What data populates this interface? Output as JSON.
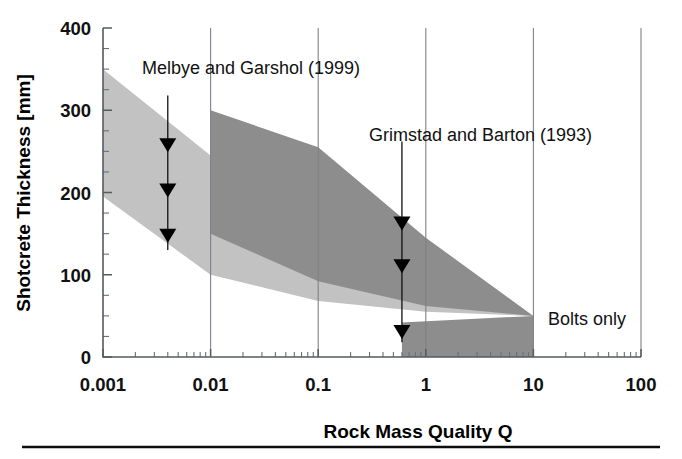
{
  "figure": {
    "caption_rule_visible": true,
    "background": "#ffffff"
  },
  "axes": {
    "x": {
      "title": "Rock Mass Quality Q",
      "scale": "log",
      "min": 0.001,
      "max": 100,
      "tick_labels": [
        "0.001",
        "0.01",
        "0.1",
        "1",
        "10",
        "100"
      ],
      "tick_values": [
        0.001,
        0.01,
        0.1,
        1,
        10,
        100
      ]
    },
    "y": {
      "title": "Shotcrete Thickness [mm]",
      "scale": "linear",
      "min": 0,
      "max": 400,
      "tick_labels": [
        "0",
        "100",
        "200",
        "300",
        "400"
      ],
      "tick_values": [
        0,
        100,
        200,
        300,
        400
      ],
      "minor_step": 25
    }
  },
  "annotations": [
    {
      "id": "melbye",
      "label": "Melbye and Garshol (1999)",
      "label_x": 0.0022,
      "label_y": 362,
      "arrow_q": 0.004,
      "arrow_top_mm": 318,
      "arrow_bottom_mm": 130,
      "arrow_head_mm": [
        255,
        200,
        145
      ]
    },
    {
      "id": "grimstad",
      "label": "Grimstad and Barton (1993)",
      "label_x": 0.55,
      "label_y": 282,
      "arrow_q": 0.6,
      "arrow_top_mm": 262,
      "arrow_bottom_mm": 18,
      "arrow_head_mm": [
        160,
        108,
        28
      ]
    },
    {
      "id": "bolts",
      "label": "Bolts only",
      "label_x": 14,
      "label_y": 50
    }
  ],
  "colors": {
    "band_light": "#c2c2c2",
    "band_dark": "#8d8d8d",
    "bolts_region": "#8d8d8d",
    "grid": "#7c8288",
    "axis": "#555b60",
    "text": "#111111"
  },
  "chart_data": {
    "type": "area",
    "title": "",
    "xlabel": "Rock Mass Quality Q",
    "ylabel": "Shotcrete Thickness [mm]",
    "xscale": "log",
    "xlim": [
      0.001,
      100
    ],
    "ylim": [
      0,
      400
    ],
    "xticks": [
      0.001,
      0.01,
      0.1,
      1,
      10,
      100
    ],
    "yticks": [
      0,
      100,
      200,
      300,
      400
    ],
    "grid": "vertical-major-only",
    "legend": "inline-annotations",
    "series": [
      {
        "name": "Melbye and Garshol (1999)",
        "kind": "band",
        "color": "#c2c2c2",
        "x": [
          0.001,
          0.01,
          0.1,
          1,
          10
        ],
        "upper": [
          350,
          245,
          155,
          100,
          50
        ],
        "lower": [
          195,
          100,
          68,
          55,
          50
        ]
      },
      {
        "name": "Grimstad and Barton (1993)",
        "kind": "band",
        "color": "#8d8d8d",
        "x": [
          0.01,
          0.1,
          1,
          10
        ],
        "upper": [
          300,
          255,
          145,
          50
        ],
        "lower": [
          150,
          92,
          62,
          50
        ]
      },
      {
        "name": "Bolts only",
        "kind": "region",
        "color": "#8d8d8d",
        "x": [
          0.6,
          10
        ],
        "upper": [
          42,
          50
        ],
        "lower": [
          0,
          0
        ]
      }
    ],
    "arrows": [
      {
        "group": "Melbye and Garshol (1999)",
        "q": 0.004,
        "y_mm": 255
      },
      {
        "group": "Melbye and Garshol (1999)",
        "q": 0.004,
        "y_mm": 200
      },
      {
        "group": "Melbye and Garshol (1999)",
        "q": 0.004,
        "y_mm": 145
      },
      {
        "group": "Grimstad and Barton (1993)",
        "q": 0.6,
        "y_mm": 160
      },
      {
        "group": "Grimstad and Barton (1993)",
        "q": 0.6,
        "y_mm": 108
      },
      {
        "group": "Grimstad and Barton (1993)",
        "q": 0.6,
        "y_mm": 28
      }
    ]
  }
}
